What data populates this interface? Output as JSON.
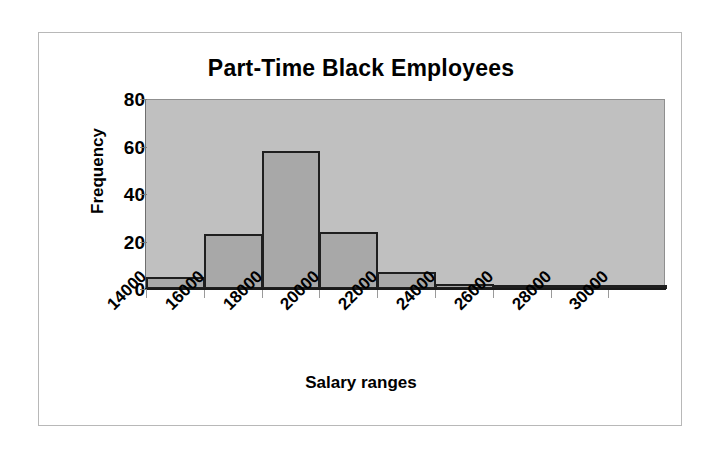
{
  "chart_data": {
    "type": "bar",
    "title": "Part-Time Black Employees",
    "xlabel": "Salary ranges",
    "ylabel": "Frequency",
    "categories": [
      "14000",
      "16000",
      "18000",
      "20000",
      "22000",
      "24000",
      "26000",
      "28000",
      "30000"
    ],
    "values": [
      5,
      23,
      58,
      24,
      7,
      2,
      1,
      0,
      1
    ],
    "ylim": [
      0,
      80
    ],
    "yticks": [
      0,
      20,
      40,
      60,
      80
    ],
    "ytick_labels": [
      "0",
      "20",
      "40",
      "60",
      "80"
    ],
    "grid": false,
    "legend": "none",
    "bar_fill_color": "#a8a8a8",
    "bar_border_color": "#1f1f1f",
    "plot_background_color": "#c0c0c0",
    "figure_background_color": "#ffffff",
    "text_color": "#000000"
  }
}
